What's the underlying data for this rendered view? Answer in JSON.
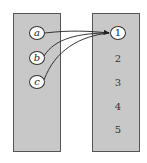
{
  "domain_set": {
    "label": "",
    "elements": [
      "a",
      "b",
      "c"
    ]
  },
  "codomain_set": {
    "label": "",
    "elements": [
      "1",
      "2",
      "3",
      "4",
      "5"
    ]
  },
  "mapping": [
    {
      "from": "a",
      "to": "1"
    },
    {
      "from": "b",
      "to": "1"
    },
    {
      "from": "c",
      "to": "1"
    }
  ],
  "colors": {
    "box_fill": "#c8c8c8",
    "box_border": "#555555",
    "arrow": "#222222"
  }
}
